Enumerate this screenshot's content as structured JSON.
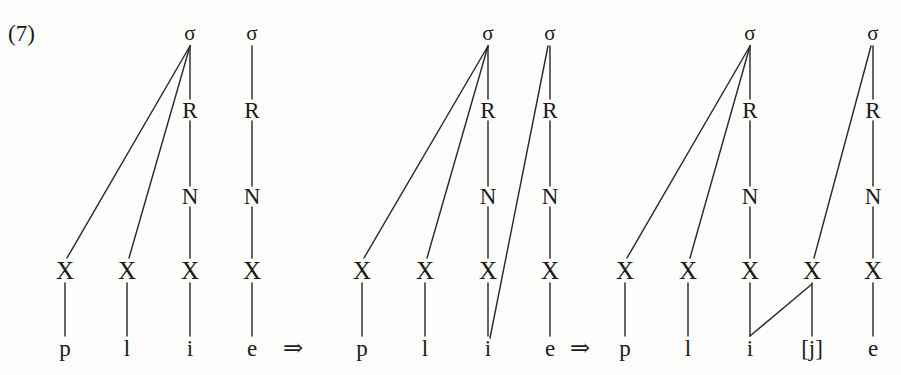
{
  "example": {
    "number": "(7)",
    "description": "Glide formation: syllable restructuring of /plie/ to [plije]"
  },
  "symbols": {
    "sigma": "σ",
    "rhyme": "R",
    "nucleus": "N",
    "skeletal_slot": "X",
    "derivation_arrow": "⇒"
  },
  "arrows": [
    {
      "label": "⇒",
      "x": 293,
      "y": 348
    },
    {
      "label": "⇒",
      "x": 580,
      "y": 348
    }
  ],
  "tiers": {
    "sigma_y": 33,
    "rhyme_y": 110,
    "nucleus_y": 196,
    "skeleton_y": 270,
    "segment_y": 348
  },
  "stages": [
    {
      "name": "stage-1-underlying",
      "syllables": [
        {
          "label": "σ",
          "x": 190,
          "rhyme": "R",
          "nucleus": "N"
        },
        {
          "label": "σ",
          "x": 252,
          "rhyme": "R",
          "nucleus": "N"
        }
      ],
      "slots": [
        {
          "label": "X",
          "x": 65
        },
        {
          "label": "X",
          "x": 127
        },
        {
          "label": "X",
          "x": 190
        },
        {
          "label": "X",
          "x": 252
        }
      ],
      "segments": [
        {
          "label": "p",
          "x": 65
        },
        {
          "label": "l",
          "x": 127
        },
        {
          "label": "i",
          "x": 190
        },
        {
          "label": "e",
          "x": 252
        }
      ],
      "edges": [
        {
          "name": "sigma1-to-x-p",
          "x1": 190,
          "y1": 46,
          "x2": 67,
          "y2": 258
        },
        {
          "name": "sigma1-to-x-l",
          "x1": 190,
          "y1": 46,
          "x2": 129,
          "y2": 258
        },
        {
          "name": "sigma1-to-r1",
          "x1": 190,
          "y1": 46,
          "x2": 190,
          "y2": 99
        },
        {
          "name": "r1-to-n1",
          "x1": 190,
          "y1": 121,
          "x2": 190,
          "y2": 186
        },
        {
          "name": "n1-to-x-i",
          "x1": 190,
          "y1": 207,
          "x2": 190,
          "y2": 258
        },
        {
          "name": "x-p-to-seg-p",
          "x1": 65,
          "y1": 283,
          "x2": 65,
          "y2": 336
        },
        {
          "name": "x-l-to-seg-l",
          "x1": 127,
          "y1": 283,
          "x2": 127,
          "y2": 336
        },
        {
          "name": "x-i-to-seg-i",
          "x1": 190,
          "y1": 283,
          "x2": 190,
          "y2": 336
        },
        {
          "name": "x-e-to-seg-e",
          "x1": 252,
          "y1": 283,
          "x2": 252,
          "y2": 336
        },
        {
          "name": "sigma2-to-r2",
          "x1": 252,
          "y1": 46,
          "x2": 252,
          "y2": 99
        },
        {
          "name": "r2-to-n2",
          "x1": 252,
          "y1": 121,
          "x2": 252,
          "y2": 186
        },
        {
          "name": "n2-to-x-e",
          "x1": 252,
          "y1": 207,
          "x2": 252,
          "y2": 258
        }
      ]
    },
    {
      "name": "stage-2-resyllabification",
      "syllables": [
        {
          "label": "σ",
          "x": 488,
          "rhyme": "R",
          "nucleus": "N"
        },
        {
          "label": "σ",
          "x": 550,
          "rhyme": "R",
          "nucleus": "N"
        }
      ],
      "slots": [
        {
          "label": "X",
          "x": 362
        },
        {
          "label": "X",
          "x": 425
        },
        {
          "label": "X",
          "x": 488
        },
        {
          "label": "X",
          "x": 550
        }
      ],
      "segments": [
        {
          "label": "p",
          "x": 362
        },
        {
          "label": "l",
          "x": 425
        },
        {
          "label": "i",
          "x": 488
        },
        {
          "label": "e",
          "x": 550
        }
      ],
      "edges": [
        {
          "name": "sigma1-to-x-p",
          "x1": 488,
          "y1": 46,
          "x2": 364,
          "y2": 258
        },
        {
          "name": "sigma1-to-x-l",
          "x1": 488,
          "y1": 46,
          "x2": 427,
          "y2": 258
        },
        {
          "name": "sigma1-to-r1",
          "x1": 488,
          "y1": 46,
          "x2": 488,
          "y2": 99
        },
        {
          "name": "r1-to-n1",
          "x1": 488,
          "y1": 121,
          "x2": 488,
          "y2": 186
        },
        {
          "name": "n1-to-x-i",
          "x1": 488,
          "y1": 207,
          "x2": 488,
          "y2": 258
        },
        {
          "name": "x-p-to-seg-p",
          "x1": 362,
          "y1": 283,
          "x2": 362,
          "y2": 336
        },
        {
          "name": "x-l-to-seg-l",
          "x1": 425,
          "y1": 283,
          "x2": 425,
          "y2": 336
        },
        {
          "name": "x-i-to-seg-i",
          "x1": 488,
          "y1": 283,
          "x2": 488,
          "y2": 336
        },
        {
          "name": "x-e-to-seg-e",
          "x1": 550,
          "y1": 283,
          "x2": 550,
          "y2": 336
        },
        {
          "name": "sigma2-to-r2",
          "x1": 550,
          "y1": 46,
          "x2": 550,
          "y2": 99
        },
        {
          "name": "r2-to-n2",
          "x1": 550,
          "y1": 121,
          "x2": 550,
          "y2": 186
        },
        {
          "name": "n2-to-x-e",
          "x1": 550,
          "y1": 207,
          "x2": 550,
          "y2": 258
        },
        {
          "name": "sigma2-to-seg-i-spread",
          "x1": 548,
          "y1": 46,
          "x2": 490,
          "y2": 338
        }
      ]
    },
    {
      "name": "stage-3-glide-formation",
      "syllables": [
        {
          "label": "σ",
          "x": 750,
          "rhyme": "R",
          "nucleus": "N"
        },
        {
          "label": "σ",
          "x": 873,
          "rhyme": "R",
          "nucleus": "N"
        }
      ],
      "slots": [
        {
          "label": "X",
          "x": 625
        },
        {
          "label": "X",
          "x": 688
        },
        {
          "label": "X",
          "x": 750
        },
        {
          "label": "X",
          "x": 812
        },
        {
          "label": "X",
          "x": 873
        }
      ],
      "segments": [
        {
          "label": "p",
          "x": 625
        },
        {
          "label": "l",
          "x": 688
        },
        {
          "label": "i",
          "x": 750
        },
        {
          "label": "[j]",
          "x": 812
        },
        {
          "label": "e",
          "x": 873
        }
      ],
      "edges": [
        {
          "name": "sigma1-to-x-p",
          "x1": 750,
          "y1": 46,
          "x2": 627,
          "y2": 258
        },
        {
          "name": "sigma1-to-x-l",
          "x1": 750,
          "y1": 46,
          "x2": 690,
          "y2": 258
        },
        {
          "name": "sigma1-to-r1",
          "x1": 750,
          "y1": 46,
          "x2": 750,
          "y2": 99
        },
        {
          "name": "r1-to-n1",
          "x1": 750,
          "y1": 121,
          "x2": 750,
          "y2": 186
        },
        {
          "name": "n1-to-x-i",
          "x1": 750,
          "y1": 207,
          "x2": 750,
          "y2": 258
        },
        {
          "name": "x-p-to-seg-p",
          "x1": 625,
          "y1": 283,
          "x2": 625,
          "y2": 336
        },
        {
          "name": "x-l-to-seg-l",
          "x1": 688,
          "y1": 283,
          "x2": 688,
          "y2": 336
        },
        {
          "name": "x-i-to-seg-i",
          "x1": 750,
          "y1": 283,
          "x2": 750,
          "y2": 336
        },
        {
          "name": "x-j-to-seg-j",
          "x1": 812,
          "y1": 283,
          "x2": 812,
          "y2": 336
        },
        {
          "name": "x-e-to-seg-e",
          "x1": 873,
          "y1": 283,
          "x2": 873,
          "y2": 336
        },
        {
          "name": "seg-i-to-x-j-spread",
          "x1": 750,
          "y1": 336,
          "x2": 812,
          "y2": 284
        },
        {
          "name": "sigma2-to-x-j",
          "x1": 871,
          "y1": 46,
          "x2": 814,
          "y2": 258
        },
        {
          "name": "sigma2-to-r2",
          "x1": 873,
          "y1": 46,
          "x2": 873,
          "y2": 99
        },
        {
          "name": "r2-to-n2",
          "x1": 873,
          "y1": 121,
          "x2": 873,
          "y2": 186
        },
        {
          "name": "n2-to-x-e",
          "x1": 873,
          "y1": 207,
          "x2": 873,
          "y2": 258
        }
      ]
    }
  ]
}
